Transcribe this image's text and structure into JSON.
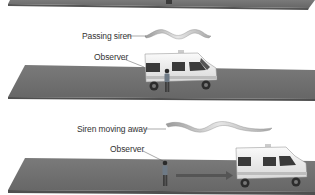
{
  "figure": {
    "panels": [
      {
        "id": "top-road-partial",
        "description": "Bottom edge of previous panel road (cropped)"
      },
      {
        "id": "passing",
        "wave_label": "Passing siren",
        "observer_label": "Observer"
      },
      {
        "id": "moving-away",
        "wave_label": "Siren moving away",
        "observer_label": "Observer",
        "arrow": "motion-direction-right"
      }
    ],
    "colors": {
      "road": "#6b6b6b",
      "road_edge": "#4f4f4f",
      "road_top_highlight": "#8a8a8a",
      "background": "#ffffff",
      "arrow": "#555555",
      "van_body": "#f2f2f2",
      "text": "#333333"
    }
  }
}
